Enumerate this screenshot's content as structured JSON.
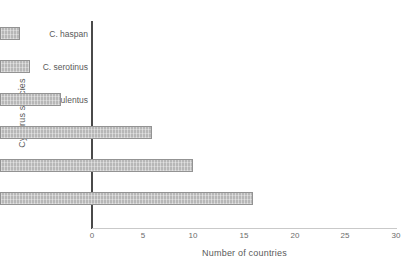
{
  "chart_data": {
    "type": "bar",
    "orientation": "horizontal",
    "title": "",
    "xlabel": "Number of countries",
    "ylabel": "Cyperus species",
    "categories": [
      "C. haspan",
      "C. serotinus",
      "C. esculentus",
      "C. iria",
      "C. rotundus",
      "C. difformis"
    ],
    "values": [
      2,
      3,
      6,
      15,
      19,
      25
    ],
    "xlim": [
      0,
      30
    ],
    "xticks": [
      0,
      5,
      10,
      15,
      20,
      25,
      30
    ],
    "xtick_labels": [
      "0",
      "5",
      "10",
      "15",
      "20",
      "25",
      "30"
    ],
    "grid": false,
    "legend": null,
    "bar_fill_color": "#b7b7b7",
    "bar_border_color": "#939393",
    "axis_color": "#4a4a4a",
    "text_color": "#5a5a5a"
  }
}
